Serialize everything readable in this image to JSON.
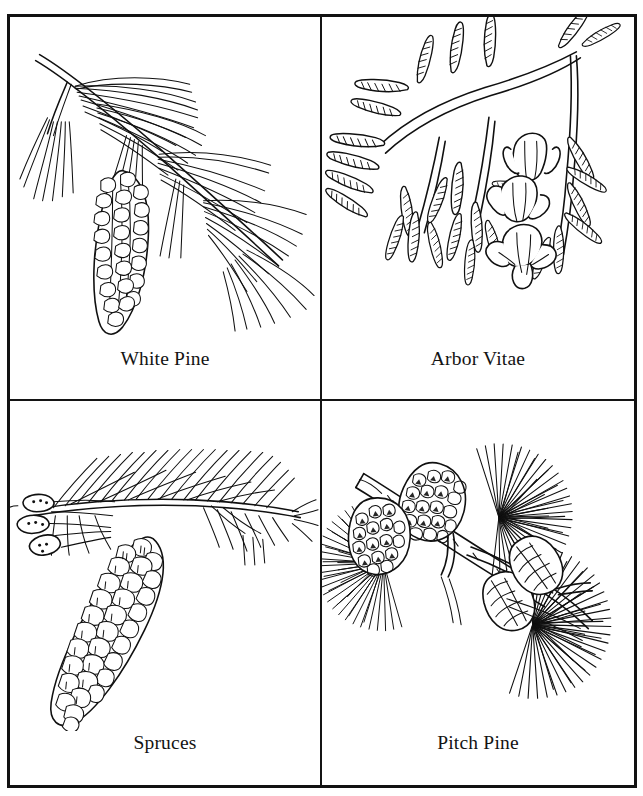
{
  "page": {
    "background_color": "#ffffff",
    "ink_color": "#101010",
    "border_color": "#121212",
    "style": "black-and-white pen-and-ink botanical line drawings",
    "layout": "2 by 2 bordered grid of labeled specimen illustrations"
  },
  "grid": {
    "columns": 2,
    "rows": 2,
    "cells": [
      {
        "position": "top-left",
        "label": "White Pine",
        "icon": "white-pine-branch-illustration",
        "subject": "pine branch with long slender needle clusters and one elongated pendant cone",
        "cone_count": 1,
        "orientation": "branch running from upper-left down to lower-right"
      },
      {
        "position": "top-right",
        "label": "Arbor Vitae",
        "icon": "arbor-vitae-spray-illustration",
        "subject": "flat scale-leaf sprays with three small open tulip-shaped cones",
        "cone_count": 3,
        "orientation": "fan of flattened sprays spreading left and downward"
      },
      {
        "position": "bottom-left",
        "label": "Spruces",
        "icon": "spruce-branch-illustration",
        "subject": "needled branch with small buds at left and one large pendant scaly cone",
        "cone_count": 1,
        "orientation": "horizontal branch with cone hanging down-left"
      },
      {
        "position": "bottom-right",
        "label": "Pitch Pine",
        "icon": "pitch-pine-branch-illustration",
        "subject": "stout branch with three dense needle tufts and clustered dark cones",
        "cone_count": 4,
        "orientation": "branch from upper-left to lower-right with radiating needle bundles"
      }
    ]
  }
}
